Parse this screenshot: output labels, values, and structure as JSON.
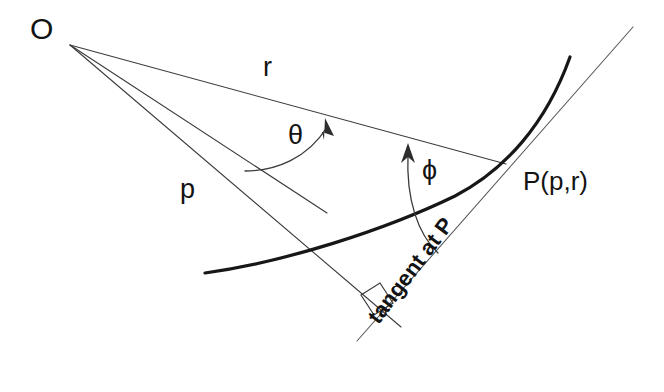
{
  "figure": {
    "type": "geometry-diagram",
    "title_text": "",
    "background_color": "#ffffff",
    "stroke_color": "#2e2e2e",
    "curve_color": "#171717",
    "labels": {
      "origin": "O",
      "radius": "r",
      "perpendicular": "p",
      "theta": "θ",
      "phi": "ϕ",
      "point": "P(p,r)",
      "tangent": "tangent at P"
    },
    "geometry": {
      "origin_point": [
        68,
        43
      ],
      "point_P": [
        505,
        165
      ],
      "radius_line": [
        [
          68,
          43
        ],
        [
          505,
          165
        ]
      ],
      "reference_ray": [
        [
          68,
          43
        ],
        [
          327,
          213
        ]
      ],
      "perpendicular_line": [
        [
          68,
          43
        ],
        [
          400,
          325
        ]
      ],
      "tangent_line": [
        [
          358,
          340
        ],
        [
          632,
          28
        ]
      ],
      "curve_points": [
        [
          205,
          273
        ],
        [
          330,
          250
        ],
        [
          430,
          215
        ],
        [
          505,
          165
        ],
        [
          552,
          100
        ],
        [
          570,
          56
        ]
      ],
      "right_angle_marker_at": [
        378,
        300
      ],
      "theta_arc": {
        "from": [
          245,
          170
        ],
        "to": [
          330,
          124
        ],
        "arrow_direction": "up-right"
      },
      "phi_arc": {
        "from": [
          436,
          252
        ],
        "to": [
          410,
          150
        ],
        "arrow_direction": "up"
      }
    }
  }
}
